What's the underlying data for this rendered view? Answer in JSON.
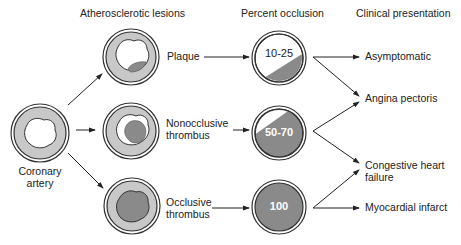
{
  "headers": {
    "lesions": "Atherosclerotic lesions",
    "occlusion": "Percent occlusion",
    "presentation": "Clinical presentation"
  },
  "source": {
    "label_line1": "Coronary",
    "label_line2": "artery"
  },
  "lesions": [
    {
      "label_line1": "Plaque",
      "label_line2": ""
    },
    {
      "label_line1": "Nonocclusive",
      "label_line2": "thrombus"
    },
    {
      "label_line1": "Occlusive",
      "label_line2": "thrombus"
    }
  ],
  "occlusion": [
    {
      "value": "10-25"
    },
    {
      "value": "50-70"
    },
    {
      "value": "100"
    }
  ],
  "presentations": [
    {
      "label_line1": "Asymptomatic",
      "label_line2": ""
    },
    {
      "label_line1": "Angina pectoris",
      "label_line2": ""
    },
    {
      "label_line1": "Congestive heart",
      "label_line2": "failure"
    },
    {
      "label_line1": "Myocardial infarct",
      "label_line2": ""
    }
  ],
  "colors": {
    "wall": "#c8c8c8",
    "thrombus": "#8a8a8a",
    "outline": "#333333",
    "lumen": "#ffffff"
  }
}
